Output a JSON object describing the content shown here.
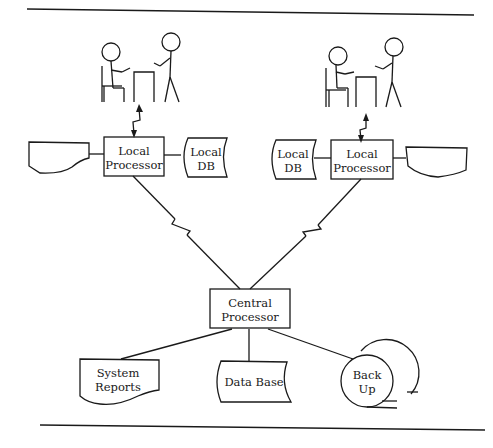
{
  "diagram": {
    "type": "network-system-flowchart",
    "nodes": {
      "left_local_processor": {
        "line1": "Local",
        "line2": "Processor"
      },
      "left_local_db": {
        "line1": "Local",
        "line2": "DB"
      },
      "right_local_db": {
        "line1": "Local",
        "line2": "DB"
      },
      "right_local_processor": {
        "line1": "Local",
        "line2": "Processor"
      },
      "central_processor": {
        "line1": "Central",
        "line2": "Processor"
      },
      "system_reports": {
        "line1": "System",
        "line2": "Reports"
      },
      "data_base": {
        "line1": "Data Base"
      },
      "back_up": {
        "line1": "Back",
        "line2": "Up"
      }
    },
    "shapes": [
      {
        "id": "left_terminal",
        "shape": "display"
      },
      {
        "id": "right_terminal",
        "shape": "display"
      },
      {
        "id": "left_users",
        "shape": "stick-figures-at-table"
      },
      {
        "id": "right_users",
        "shape": "stick-figures-at-table"
      }
    ],
    "edges": [
      {
        "from": "left_users",
        "to": "left_local_processor",
        "style": "communication-link-bidirectional"
      },
      {
        "from": "right_users",
        "to": "right_local_processor",
        "style": "communication-link-bidirectional"
      },
      {
        "from": "left_terminal",
        "to": "left_local_processor"
      },
      {
        "from": "left_local_processor",
        "to": "left_local_db"
      },
      {
        "from": "right_local_db",
        "to": "right_local_processor"
      },
      {
        "from": "right_local_processor",
        "to": "right_terminal"
      },
      {
        "from": "left_local_processor",
        "to": "central_processor",
        "style": "communication-link"
      },
      {
        "from": "right_local_processor",
        "to": "central_processor",
        "style": "communication-link"
      },
      {
        "from": "central_processor",
        "to": "system_reports"
      },
      {
        "from": "central_processor",
        "to": "data_base"
      },
      {
        "from": "central_processor",
        "to": "back_up"
      }
    ]
  }
}
